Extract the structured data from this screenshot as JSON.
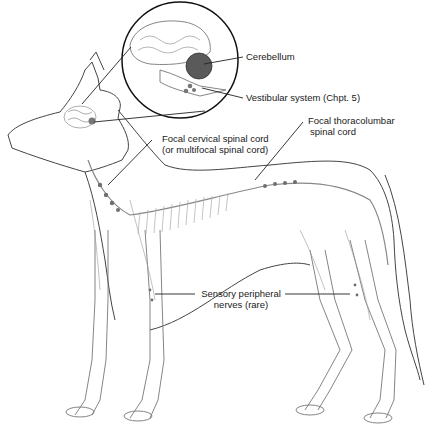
{
  "figure": {
    "labels": {
      "cerebellum": "Cerebellum",
      "vestibular": "Vestibular system (Chpt. 5)",
      "cervical_line1": "Focal cervical spinal cord",
      "cervical_line2": "(or multifocal spinal cord)",
      "thoracolumbar_line1": "Focal thoracolumbar",
      "thoracolumbar_line2": "spinal cord",
      "peripheral_line1": "Sensory peripheral",
      "peripheral_line2": "nerves (rare)"
    },
    "colors": {
      "outline": "#444444",
      "skeleton": "#9a9a9a",
      "lesion": "#6e6e6e",
      "cerebellum_fill": "#555555",
      "leader": "#222222"
    }
  }
}
